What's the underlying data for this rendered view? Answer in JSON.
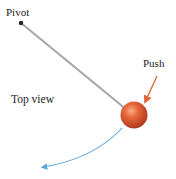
{
  "labels": {
    "pivot": "Pivot",
    "push": "Push",
    "view": "Top view"
  },
  "icons": {
    "pivot_point": "pivot-dot-icon",
    "rod": "rod-line",
    "ball": "ball-icon",
    "push_arrow": "arrow-icon",
    "path_arrow": "curved-arrow-icon"
  },
  "colors": {
    "rod": "#a8a8a8",
    "pivot": "#222222",
    "ball_light": "#f08a5a",
    "ball_dark": "#b8381a",
    "push_arrow": "#e0683a",
    "path_arrow": "#5aa6d8",
    "text": "#222222"
  }
}
